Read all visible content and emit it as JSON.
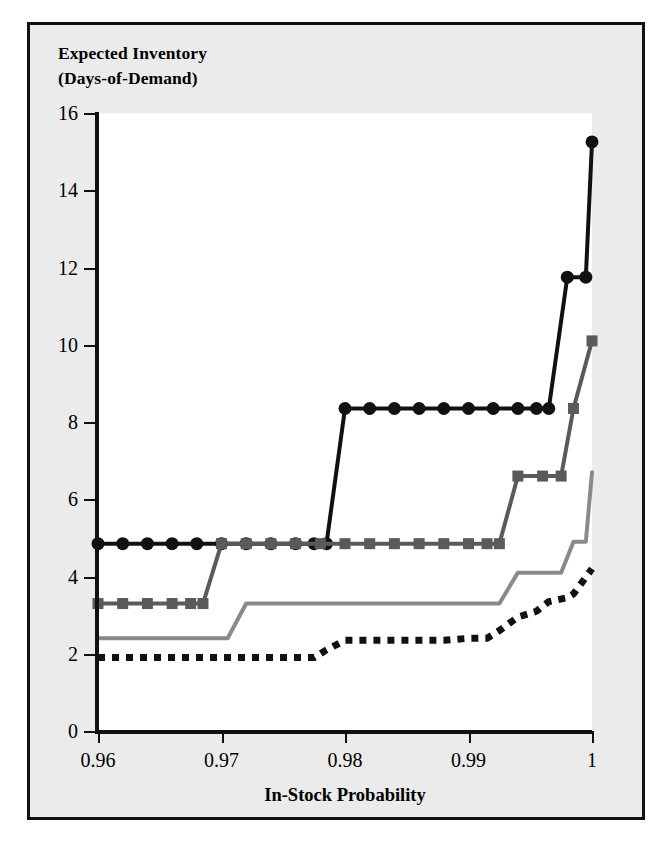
{
  "figure": {
    "background_color": "#ebebeb",
    "plot_background_color": "#ffffff",
    "frame_color": "#111111"
  },
  "axis_title_lines": "Expected Inventory\n(Days-of-Demand)",
  "chart_data": {
    "type": "line",
    "title": "Expected Inventory (Days-of-Demand)",
    "xlabel": "In-Stock Probability",
    "ylabel": "Expected Inventory (Days-of-Demand)",
    "xlim": [
      0.96,
      1.0
    ],
    "ylim": [
      0,
      16
    ],
    "xticks": [
      0.96,
      0.97,
      0.98,
      0.99,
      1
    ],
    "xtick_labels": [
      "0.96",
      "0.97",
      "0.98",
      "0.99",
      "1"
    ],
    "yticks": [
      0,
      2,
      4,
      6,
      8,
      10,
      12,
      14,
      16
    ],
    "ytick_labels": [
      "0",
      "2",
      "4",
      "6",
      "8",
      "10",
      "12",
      "14",
      "16"
    ],
    "grid": false,
    "legend": false,
    "legend_position": "none",
    "series": [
      {
        "name": "series-1-black-circles",
        "color": "#111111",
        "line_style": "solid",
        "line_width": 4,
        "marker": "circle",
        "marker_size": 13,
        "x": [
          0.96,
          0.962,
          0.964,
          0.966,
          0.968,
          0.97,
          0.972,
          0.974,
          0.976,
          0.9775,
          0.9785,
          0.98,
          0.982,
          0.984,
          0.986,
          0.988,
          0.99,
          0.992,
          0.994,
          0.9955,
          0.9965,
          0.998,
          0.9995,
          1.0
        ],
        "y": [
          4.85,
          4.85,
          4.85,
          4.85,
          4.85,
          4.85,
          4.85,
          4.85,
          4.85,
          4.85,
          4.85,
          8.35,
          8.35,
          8.35,
          8.35,
          8.35,
          8.35,
          8.35,
          8.35,
          8.35,
          8.35,
          11.75,
          11.75,
          15.25
        ]
      },
      {
        "name": "series-2-dark-gray-squares",
        "color": "#5a5a5a",
        "line_style": "solid",
        "line_width": 4,
        "marker": "square",
        "marker_size": 11,
        "x": [
          0.96,
          0.962,
          0.964,
          0.966,
          0.9675,
          0.9685,
          0.97,
          0.972,
          0.974,
          0.976,
          0.978,
          0.98,
          0.982,
          0.984,
          0.986,
          0.988,
          0.99,
          0.9915,
          0.9925,
          0.994,
          0.996,
          0.9975,
          0.9985,
          1.0
        ],
        "y": [
          3.3,
          3.3,
          3.3,
          3.3,
          3.3,
          3.3,
          4.85,
          4.85,
          4.85,
          4.85,
          4.85,
          4.85,
          4.85,
          4.85,
          4.85,
          4.85,
          4.85,
          4.85,
          4.85,
          6.6,
          6.6,
          6.6,
          8.35,
          10.1
        ]
      },
      {
        "name": "series-3-light-gray-line",
        "color": "#8a8a8a",
        "line_style": "solid",
        "line_width": 4,
        "marker": "none",
        "marker_size": 0,
        "x": [
          0.96,
          0.964,
          0.968,
          0.9695,
          0.9705,
          0.972,
          0.976,
          0.98,
          0.984,
          0.988,
          0.9915,
          0.9925,
          0.994,
          0.996,
          0.9975,
          0.9985,
          0.9995,
          1.0
        ],
        "y": [
          2.4,
          2.4,
          2.4,
          2.4,
          2.4,
          3.3,
          3.3,
          3.3,
          3.3,
          3.3,
          3.3,
          3.3,
          4.1,
          4.1,
          4.1,
          4.9,
          4.9,
          6.7
        ]
      },
      {
        "name": "series-4-black-dotted-line",
        "color": "#111111",
        "line_style": "dotted",
        "line_width": 7,
        "marker": "none",
        "marker_size": 0,
        "x": [
          0.96,
          0.964,
          0.968,
          0.972,
          0.976,
          0.9775,
          0.9785,
          0.98,
          0.984,
          0.988,
          0.99,
          0.9915,
          0.9925,
          0.994,
          0.9955,
          0.9965,
          0.998,
          0.9985,
          1.0
        ],
        "y": [
          1.9,
          1.9,
          1.9,
          1.9,
          1.9,
          1.9,
          2.1,
          2.35,
          2.35,
          2.35,
          2.4,
          2.4,
          2.6,
          2.95,
          3.1,
          3.35,
          3.45,
          3.55,
          4.2
        ]
      }
    ]
  },
  "x_axis_title": "In-Stock Probability"
}
